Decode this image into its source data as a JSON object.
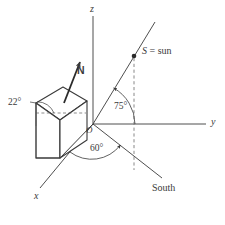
{
  "figure": {
    "type": "3d-coordinate-diagram",
    "background_color": "#ffffff",
    "stroke_color": "#3a3a3a",
    "axes": [
      {
        "id": "z",
        "label": "z",
        "label_x": 90,
        "label_y": 6
      },
      {
        "id": "y",
        "label": "y",
        "label_x": 211,
        "label_y": 118
      },
      {
        "id": "x",
        "label": "x",
        "label_x": 34,
        "label_y": 196
      }
    ],
    "origin": {
      "label": "O",
      "label_x": 87,
      "label_y": 126
    },
    "angles": [
      {
        "id": "roof-tilt",
        "label": "22°",
        "label_x": 9,
        "label_y": 101
      },
      {
        "id": "sun-elevation",
        "label": "75°",
        "label_x": 114,
        "label_y": 105
      },
      {
        "id": "sun-azimuth",
        "label": "60°",
        "label_x": 91,
        "label_y": 146
      }
    ],
    "points": [
      {
        "id": "sun-point",
        "label": "S = sun",
        "symbol": "S",
        "equals": "=",
        "word": "sun",
        "label_x": 143,
        "label_y": 48,
        "dot_x": 134,
        "dot_y": 56
      }
    ],
    "vectors": [
      {
        "id": "normal-vector",
        "label": "N",
        "label_x": 77,
        "label_y": 70
      }
    ],
    "directions": [
      {
        "id": "south-direction",
        "label": "South",
        "label_x": 153,
        "label_y": 185
      }
    ]
  }
}
